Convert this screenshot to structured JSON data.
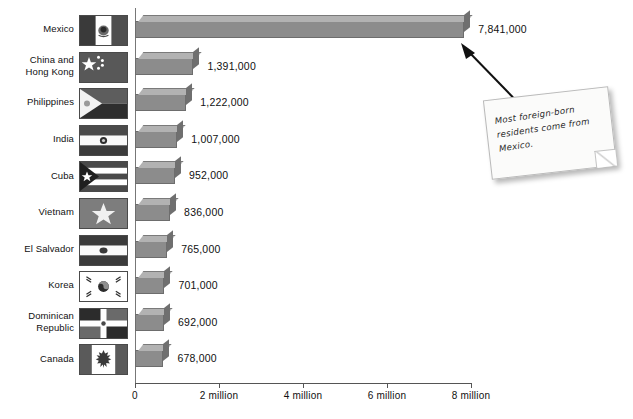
{
  "chart_data": {
    "type": "bar",
    "orientation": "horizontal",
    "title": "",
    "xlabel": "",
    "ylabel": "",
    "xlim": [
      0,
      8000000
    ],
    "grid": false,
    "legend": false,
    "categories": [
      "Mexico",
      "China and Hong Kong",
      "Philippines",
      "India",
      "Cuba",
      "Vietnam",
      "El Salvador",
      "Korea",
      "Dominican Republic",
      "Canada"
    ],
    "values": [
      7841000,
      1391000,
      1222000,
      1007000,
      952000,
      836000,
      765000,
      701000,
      692000,
      678000
    ],
    "value_labels": [
      "7,841,000",
      "1,391,000",
      "1,222,000",
      "1,007,000",
      "952,000",
      "836,000",
      "765,000",
      "701,000",
      "692,000",
      "678,000"
    ],
    "tick_values": [
      0,
      2000000,
      4000000,
      6000000,
      8000000
    ],
    "tick_labels": [
      "0",
      "2 million",
      "4 million",
      "6 million",
      "8 million"
    ],
    "annotations": [
      {
        "text": "Most foreign-born residents come from Mexico.",
        "points_to": "Mexico"
      }
    ],
    "bar_color": "#8c8c8c",
    "bar_top_color": "#b2b2b2",
    "bar_side_color": "#6f6f6f"
  },
  "rows": [
    {
      "label_lines": [
        "Mexico"
      ],
      "flag": "flag-mexico",
      "value_label": "7,841,000"
    },
    {
      "label_lines": [
        "China and",
        "Hong Kong"
      ],
      "flag": "flag-china",
      "value_label": "1,391,000"
    },
    {
      "label_lines": [
        "Philippines"
      ],
      "flag": "flag-philippines",
      "value_label": "1,222,000"
    },
    {
      "label_lines": [
        "India"
      ],
      "flag": "flag-india",
      "value_label": "1,007,000"
    },
    {
      "label_lines": [
        "Cuba"
      ],
      "flag": "flag-cuba",
      "value_label": "952,000"
    },
    {
      "label_lines": [
        "Vietnam"
      ],
      "flag": "flag-vietnam",
      "value_label": "836,000"
    },
    {
      "label_lines": [
        "El Salvador"
      ],
      "flag": "flag-el-salvador",
      "value_label": "765,000"
    },
    {
      "label_lines": [
        "Korea"
      ],
      "flag": "flag-korea",
      "value_label": "701,000"
    },
    {
      "label_lines": [
        "Dominican",
        "Republic"
      ],
      "flag": "flag-dominican-republic",
      "value_label": "692,000"
    },
    {
      "label_lines": [
        "Canada"
      ],
      "flag": "flag-canada",
      "value_label": "678,000"
    }
  ],
  "axis": {
    "ticks": [
      "0",
      "2 million",
      "4 million",
      "6 million",
      "8 million"
    ]
  },
  "callout": {
    "text": "Most foreign-born residents come from Mexico."
  }
}
